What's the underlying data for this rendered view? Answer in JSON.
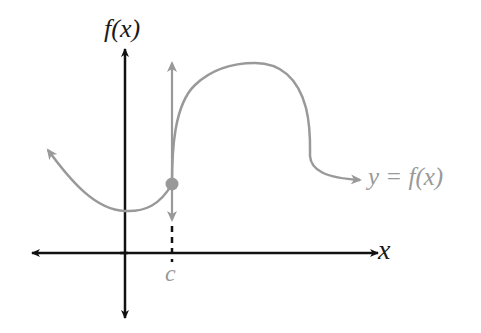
{
  "diagram": {
    "labels": {
      "y_axis": "f(x)",
      "x_axis": "x",
      "point": "c",
      "curve": "y = f(x)"
    },
    "colors": {
      "axes": "#111111",
      "curve": "#999999",
      "text_dark": "#1a1a1a",
      "text_gray": "#999999"
    },
    "elements": [
      {
        "type": "axis",
        "name": "x-axis",
        "direction": "horizontal",
        "arrows": "both"
      },
      {
        "type": "axis",
        "name": "y-axis",
        "direction": "vertical",
        "arrows": "both"
      },
      {
        "type": "curve",
        "name": "y = f(x)",
        "arrows": "both ends"
      },
      {
        "type": "tangent-line",
        "name": "vertical tangent at c",
        "arrows": "both"
      },
      {
        "type": "point",
        "name": "point (c, f(c))",
        "filled": true
      },
      {
        "type": "dashed-line",
        "name": "guide from point to c on x-axis"
      }
    ]
  }
}
